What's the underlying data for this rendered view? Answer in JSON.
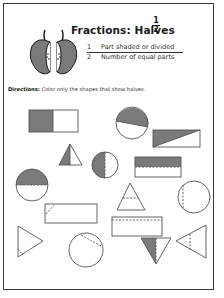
{
  "worksheet": {
    "title": "Fractions:  Halves",
    "title_fraction": {
      "numerator": "1",
      "denominator": "2"
    },
    "legend": [
      {
        "number": "1",
        "text": "Part shaded or divided"
      },
      {
        "number": "2",
        "text": "Number of equal parts"
      }
    ],
    "directions_label": "Directions:",
    "directions_text": " Color only the shapes that show halves.",
    "illustration": "apple-halves-icon",
    "colors": {
      "shade": "#7a7a7a",
      "line": "#555555",
      "border": "#3a3a3a"
    },
    "shapes": [
      {
        "id": 1,
        "type": "rectangle",
        "division": "vertical-half",
        "shaded": true
      },
      {
        "id": 2,
        "type": "circle",
        "division": "diagonal-unequal",
        "shaded": true
      },
      {
        "id": 3,
        "type": "rectangle",
        "division": "diagonal",
        "shaded": true
      },
      {
        "id": 4,
        "type": "triangle",
        "division": "vertical-half",
        "shaded": true
      },
      {
        "id": 5,
        "type": "circle",
        "division": "vertical-half",
        "shaded": true
      },
      {
        "id": 6,
        "type": "rectangle",
        "division": "horizontal-half-dashed",
        "shaded": true
      },
      {
        "id": 7,
        "type": "circle",
        "division": "horizontal-half-dashed",
        "shaded": true
      },
      {
        "id": 8,
        "type": "triangle",
        "division": "horizontal-dashed",
        "shaded": false
      },
      {
        "id": 9,
        "type": "circle",
        "division": "vertical-unequal-dashed",
        "shaded": false
      },
      {
        "id": 10,
        "type": "rectangle",
        "division": "corner-dashed",
        "shaded": false
      },
      {
        "id": 11,
        "type": "rectangle",
        "division": "horizontal-top-dashed",
        "shaded": false
      },
      {
        "id": 12,
        "type": "triangle",
        "division": "corner-dashed",
        "shaded": false
      },
      {
        "id": 13,
        "type": "circle",
        "division": "chord-dashed",
        "shaded": false
      },
      {
        "id": 14,
        "type": "triangle",
        "division": "vertical-half",
        "shaded": true
      },
      {
        "id": 15,
        "type": "triangle",
        "division": "vertical-dashed",
        "shaded": false
      }
    ]
  }
}
